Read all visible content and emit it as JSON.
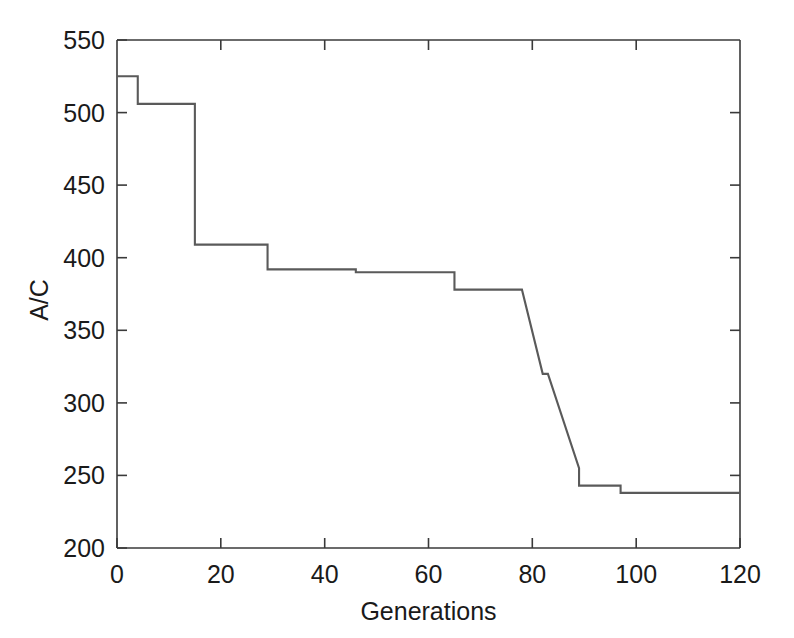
{
  "chart_data": {
    "type": "line",
    "title": "",
    "subtitle": "",
    "xlabel": "Generations",
    "ylabel": "A/C",
    "xlim": [
      0,
      120
    ],
    "ylim": [
      200,
      550
    ],
    "xticks": [
      0,
      20,
      40,
      60,
      80,
      100,
      120
    ],
    "yticks": [
      200,
      250,
      300,
      350,
      400,
      450,
      500,
      550
    ],
    "xtick_labels": [
      "0",
      "20",
      "40",
      "60",
      "80",
      "100",
      "120"
    ],
    "ytick_labels": [
      "200",
      "250",
      "300",
      "350",
      "400",
      "450",
      "500",
      "550"
    ],
    "grid": false,
    "legend": null,
    "legend_position": "none",
    "annotations": [],
    "line_color": "#5a5a5a",
    "axis_color": "#3a3a3a",
    "background_color": "#ffffff",
    "step_style": "post",
    "series": [
      {
        "name": "best cost per generation",
        "x": [
          0,
          4,
          4,
          15,
          15,
          29,
          29,
          46,
          46,
          65,
          65,
          78,
          82,
          83,
          89,
          89,
          97,
          97,
          120
        ],
        "y": [
          525,
          525,
          506,
          506,
          409,
          409,
          392,
          392,
          390,
          390,
          378,
          378,
          320,
          320,
          255,
          243,
          243,
          238,
          238
        ],
        "points": [
          {
            "generation": 0,
            "value": 525
          },
          {
            "generation": 4,
            "value": 525
          },
          {
            "generation": 5,
            "value": 506
          },
          {
            "generation": 15,
            "value": 506
          },
          {
            "generation": 16,
            "value": 409
          },
          {
            "generation": 29,
            "value": 409
          },
          {
            "generation": 30,
            "value": 392
          },
          {
            "generation": 46,
            "value": 392
          },
          {
            "generation": 47,
            "value": 390
          },
          {
            "generation": 65,
            "value": 390
          },
          {
            "generation": 66,
            "value": 378
          },
          {
            "generation": 78,
            "value": 378
          },
          {
            "generation": 82,
            "value": 320
          },
          {
            "generation": 83,
            "value": 320
          },
          {
            "generation": 84,
            "value": 255
          },
          {
            "generation": 89,
            "value": 255
          },
          {
            "generation": 90,
            "value": 243
          },
          {
            "generation": 97,
            "value": 243
          },
          {
            "generation": 98,
            "value": 238
          },
          {
            "generation": 120,
            "value": 238
          }
        ]
      }
    ]
  }
}
